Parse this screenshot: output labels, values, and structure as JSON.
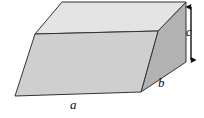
{
  "figure": {
    "shape_name": "parallelepiped",
    "background_color": "#ffffff",
    "outline_color": "#333333",
    "faces": {
      "top": {
        "name": "top-face",
        "fill": "#e4e4e4",
        "points": "62,2 186,2 158,31 35,34"
      },
      "front": {
        "name": "front-face",
        "fill": "#cfcfcf",
        "points": "35,34 158,31 141,92 15,96"
      },
      "right": {
        "name": "right-face",
        "fill": "#b2b2b2",
        "points": "158,31 186,2 186,62 141,92"
      }
    },
    "dimension_labels": [
      {
        "key": "a",
        "text": "a",
        "meaning": "length-of-bottom-edge",
        "x": 70,
        "y": 98
      },
      {
        "key": "b",
        "text": "b",
        "meaning": "depth-edge",
        "x": 158,
        "y": 76
      },
      {
        "key": "c",
        "text": "c",
        "meaning": "height-edge",
        "x": 186,
        "y": 26
      }
    ],
    "height_arrow": {
      "name": "height-dimension-arrow",
      "color": "#111111",
      "x": 191,
      "y_top": 3,
      "y_bottom": 64,
      "double_headed": true
    }
  }
}
